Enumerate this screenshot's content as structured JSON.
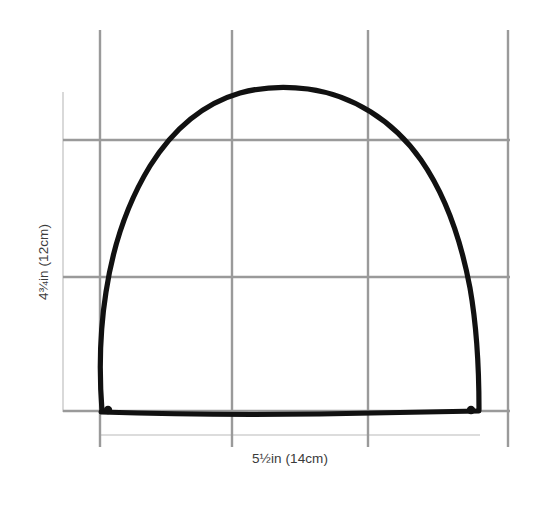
{
  "figure": {
    "kind": "technical-drawing",
    "background_color": "#ffffff",
    "outline_color": "#111111",
    "grid_color": "#9a9a9a",
    "guide_color": "#d8d8d8",
    "label_color": "#3a3a3a",
    "labels": {
      "height": "4¾in (12cm)",
      "width": "5½in (14cm)"
    },
    "measurements": [
      {
        "name": "height",
        "inches": "4¾",
        "centimeters": "12",
        "text": "4¾in (12cm)",
        "orientation": "vertical"
      },
      {
        "name": "width",
        "inches": "5½",
        "centimeters": "14",
        "text": "5½in (14cm)",
        "orientation": "horizontal"
      }
    ],
    "grid": {
      "vertical_lines_x": [
        100,
        232,
        368,
        508
      ],
      "horizontal_lines_y": [
        140,
        277,
        411
      ],
      "vertical_span_y": [
        30,
        447
      ],
      "horizontal_span_x": [
        63,
        510
      ]
    },
    "guides": {
      "vertical_guide_x": 63,
      "vertical_guide_span_y": [
        92,
        412
      ],
      "horizontal_guide_y": 435,
      "horizontal_guide_span_x": [
        100,
        480
      ]
    },
    "shape": {
      "baseline_y": 411,
      "left_x": 100,
      "right_x": 480,
      "apex_x": 290,
      "apex_y": 88
    }
  }
}
